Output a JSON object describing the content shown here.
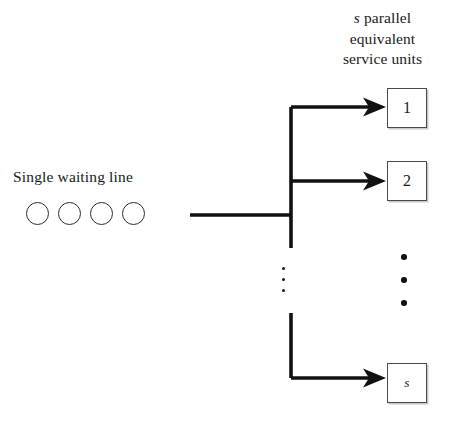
{
  "diagram": {
    "background_color": "#ffffff",
    "line_color": "#111111",
    "box_border_color": "#4a4a4a",
    "text_color": "#1a1a1a"
  },
  "header": {
    "line1_italic": "s",
    "line1_rest": " parallel",
    "line2": "equivalent",
    "line3": "service units"
  },
  "queue": {
    "label": "Single waiting line",
    "customer_count": 4,
    "customers": [
      "",
      "",
      "",
      ""
    ]
  },
  "service_units": [
    {
      "id": "unit-1",
      "label": "1",
      "italic": false
    },
    {
      "id": "unit-2",
      "label": "2",
      "italic": false
    },
    {
      "id": "unit-s",
      "label": "s",
      "italic": true
    }
  ],
  "ellipsis": {
    "right_column_dots": 3,
    "trunk_dots": 3,
    "meaning": "units 3 through s-1 omitted"
  },
  "flow": {
    "inlet_description": "single line feeds a common trunk",
    "branch_count": 3,
    "branch_targets": [
      "1",
      "2",
      "s"
    ]
  }
}
